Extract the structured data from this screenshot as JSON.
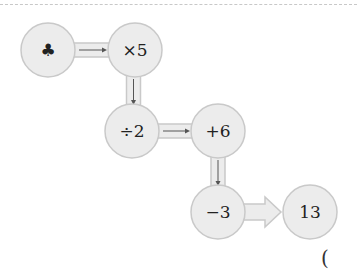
{
  "diagram": {
    "nodes": [
      {
        "id": "start",
        "label": "♣",
        "icon": "club-icon"
      },
      {
        "id": "op1",
        "label": "×5"
      },
      {
        "id": "op2",
        "label": "÷2"
      },
      {
        "id": "op3",
        "label": "+6"
      },
      {
        "id": "op4",
        "label": "−3"
      },
      {
        "id": "result",
        "label": "13"
      }
    ],
    "edges": [
      {
        "from": "start",
        "to": "op1"
      },
      {
        "from": "op1",
        "to": "op2"
      },
      {
        "from": "op2",
        "to": "op3"
      },
      {
        "from": "op3",
        "to": "op4"
      },
      {
        "from": "op4",
        "to": "result"
      }
    ],
    "answer_paren": "("
  },
  "colors": {
    "node_fill": "#ececec",
    "node_stroke": "#c9c9c9",
    "arrow": "#555555"
  }
}
